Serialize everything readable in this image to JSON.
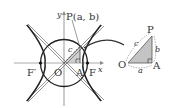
{
  "diagram": {
    "type": "hyperbola-with-auxiliary-circle",
    "axes": {
      "x_label": "x",
      "y_label": "y",
      "origin_label": "O"
    },
    "foci": {
      "left": "F′",
      "right": "F"
    },
    "points": {
      "P": {
        "label": "P(a, b)"
      },
      "A": {
        "label": "A"
      }
    },
    "segment_labels": {
      "hypotenuse": "c"
    },
    "inset_triangle": {
      "vertices": {
        "O": "O",
        "A": "A",
        "P": "P"
      },
      "sides": {
        "OA": "a",
        "AP": "b",
        "OP": "c"
      },
      "right_angle_at": "A"
    },
    "colors": {
      "curve": "#222222",
      "axis": "#9a9a9a",
      "asymptote": "#555555",
      "triangle_fill": "#c8c8c8",
      "arrow": "#333333"
    }
  }
}
